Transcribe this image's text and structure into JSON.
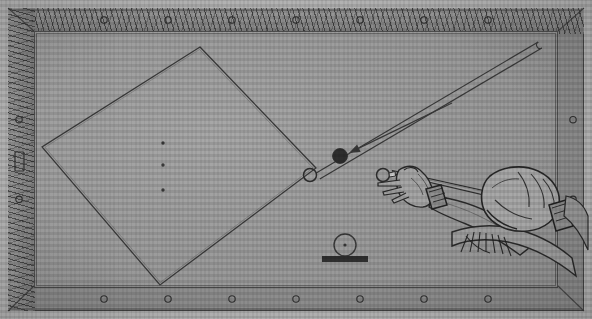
{
  "illustration": {
    "title": "Billiard table bank-shot diagram",
    "caption": "",
    "style": "halftone engraving",
    "colors": {
      "paper": "#b4b4b4",
      "cloth": "#9d9d9d",
      "wood_rail": "#8d8d8d",
      "ink": "#3a3a3a",
      "object_ball": "#2e2e2e"
    }
  },
  "table": {
    "name": "billiard-table",
    "surface_label": "cloth",
    "frame_label": "wood rail",
    "rail_sights": {
      "top_count": 7,
      "bottom_count": 7,
      "left_count": 2,
      "right_count": 2,
      "shape": "circle"
    },
    "left_rail_marker": {
      "name": "rail-plate",
      "shape": "rectangle"
    }
  },
  "diagram": {
    "aim_polygon": {
      "name": "diamond-aim-path",
      "label": "diamond path",
      "points": [
        {
          "x": 200,
          "y": 47
        },
        {
          "x": 316,
          "y": 168
        },
        {
          "x": 160,
          "y": 285
        },
        {
          "x": 42,
          "y": 147
        }
      ]
    },
    "center_spots": [
      {
        "x": 163,
        "y": 143
      },
      {
        "x": 163,
        "y": 165
      },
      {
        "x": 163,
        "y": 190
      }
    ],
    "corridor": {
      "name": "rail-return-corridor",
      "label": "cue path corridor",
      "start": {
        "x": 318,
        "y": 176
      },
      "end": {
        "x": 540,
        "y": 45
      },
      "width": 7
    },
    "arrow": {
      "name": "direction-arrow",
      "label": "ball direction",
      "from": {
        "x": 452,
        "y": 103
      },
      "to": {
        "x": 349,
        "y": 153
      }
    }
  },
  "balls": [
    {
      "name": "object-ball",
      "label": "object ball",
      "x": 340,
      "y": 156,
      "r": 7.5,
      "filled": true
    },
    {
      "name": "cue-ball-left",
      "label": "ball at diamond vertex",
      "x": 310,
      "y": 175,
      "r": 6.5,
      "filled": false
    },
    {
      "name": "cue-ball-right",
      "label": "cue ball",
      "x": 383,
      "y": 175,
      "r": 6.5,
      "filled": false
    }
  ],
  "inset": {
    "name": "ball-on-rail-inset",
    "label": "ball resting on rail",
    "ball": {
      "x": 345,
      "y": 245,
      "r": 11
    },
    "center_dot": true,
    "bar": {
      "x": 322,
      "y": 256,
      "width": 46,
      "height": 6
    }
  },
  "player": {
    "name": "player-hands",
    "bridge_hand": {
      "name": "bridge-hand",
      "label": "bridge hand"
    },
    "grip_hand": {
      "name": "grip-hand",
      "label": "grip hand"
    },
    "cue": {
      "name": "cue-stick",
      "label": "cue stick"
    },
    "cuffs": [
      {
        "name": "wrist-cuff-front",
        "label": "shirt cuff"
      },
      {
        "name": "wrist-cuff-rear",
        "label": "shirt cuff"
      }
    ]
  }
}
